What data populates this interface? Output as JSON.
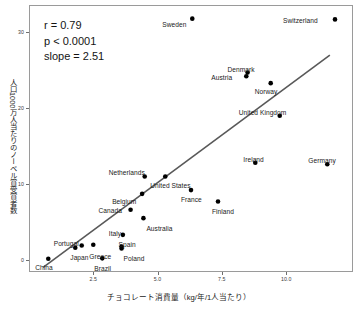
{
  "chart_data": {
    "type": "scatter",
    "title": "",
    "xlabel": "チョコレート消費量（kg/年/1人当たり）",
    "ylabel": "人口1000万人当たりのノーベル賞受賞者数",
    "xlim": [
      0.0,
      12.6
    ],
    "ylim": [
      -1.6,
      33.6
    ],
    "xticks": [
      "2.5",
      "5.0",
      "7.5",
      "10.0"
    ],
    "xtick_values": [
      2.5,
      5.0,
      7.5,
      10.0
    ],
    "yticks": [
      "0",
      "10",
      "20",
      "30"
    ],
    "ytick_values": [
      0,
      10,
      20,
      30
    ],
    "grid": false,
    "legend": false,
    "annotations": {
      "r": "r = 0.79",
      "p": "p < 0.0001",
      "slope": "slope = 2.51"
    },
    "trendline": {
      "type": "linear",
      "slope": 2.51,
      "x_start": 0.55,
      "x_end": 11.7,
      "y_start": -1.0,
      "y_end": 27.0,
      "color": "#595959"
    },
    "point_color": "#000000",
    "points": [
      {
        "label": "China",
        "x": 0.75,
        "y": 0.15,
        "lx": -13,
        "ly": 9
      },
      {
        "label": "Japan",
        "x": 1.8,
        "y": 1.6,
        "lx": -5,
        "ly": 10
      },
      {
        "label": "Portugal",
        "x": 2.05,
        "y": 1.9,
        "lx": -28,
        "ly": -1
      },
      {
        "label": "Brazil",
        "x": 2.85,
        "y": 0.2,
        "lx": -8,
        "ly": 11
      },
      {
        "label": "Greece",
        "x": 2.5,
        "y": 2.0,
        "lx": -4,
        "ly": 12
      },
      {
        "label": "Spain",
        "x": 3.6,
        "y": 1.75,
        "lx": -3,
        "ly": -2
      },
      {
        "label": "Poland",
        "x": 3.6,
        "y": 1.5,
        "lx": 2,
        "ly": 11
      },
      {
        "label": "Italy",
        "x": 3.65,
        "y": 3.3,
        "lx": -14,
        "ly": -1
      },
      {
        "label": "Australia",
        "x": 4.45,
        "y": 5.5,
        "lx": 3,
        "ly": 11
      },
      {
        "label": "Canada",
        "x": 3.95,
        "y": 6.6,
        "lx": -32,
        "ly": 1
      },
      {
        "label": "Belgium",
        "x": 4.4,
        "y": 8.7,
        "lx": -30,
        "ly": 8
      },
      {
        "label": "Netherlands",
        "x": 4.5,
        "y": 11.0,
        "lx": -36,
        "ly": -3
      },
      {
        "label": "United States",
        "x": 5.3,
        "y": 11.0,
        "lx": -15,
        "ly": 10
      },
      {
        "label": "France",
        "x": 6.3,
        "y": 9.2,
        "lx": -10,
        "ly": 10
      },
      {
        "label": "Finland",
        "x": 7.35,
        "y": 7.7,
        "lx": -6,
        "ly": 11
      },
      {
        "label": "Sweden",
        "x": 6.35,
        "y": 31.8,
        "lx": -30,
        "ly": 6
      },
      {
        "label": "Denmark",
        "x": 8.5,
        "y": 24.7,
        "lx": -20,
        "ly": -3
      },
      {
        "label": "Austria",
        "x": 8.45,
        "y": 24.2,
        "lx": -35,
        "ly": 2
      },
      {
        "label": "Norway",
        "x": 9.4,
        "y": 23.3,
        "lx": -16,
        "ly": 9
      },
      {
        "label": "United Kingdom",
        "x": 9.75,
        "y": 19.0,
        "lx": -41,
        "ly": -3
      },
      {
        "label": "Ireland",
        "x": 8.8,
        "y": 12.8,
        "lx": -12,
        "ly": -3
      },
      {
        "label": "Germany",
        "x": 11.6,
        "y": 12.6,
        "lx": -19,
        "ly": -3
      },
      {
        "label": "Switzerland",
        "x": 11.9,
        "y": 31.7,
        "lx": -52,
        "ly": 2
      }
    ]
  }
}
